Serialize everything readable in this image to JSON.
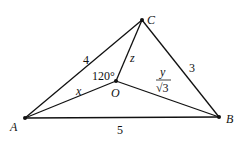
{
  "points": {
    "A": "A",
    "B": "B",
    "C": "C",
    "O": "O"
  },
  "sides": {
    "AC": "4",
    "CB": "3",
    "AB": "5"
  },
  "segments": {
    "OA": "x",
    "OC": "z",
    "OB_num": "y",
    "OB_den": "√3"
  },
  "angle": "120°"
}
